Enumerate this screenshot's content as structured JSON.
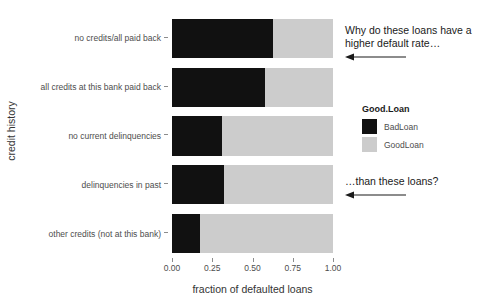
{
  "chart_data": {
    "type": "bar",
    "orientation": "horizontal",
    "stacked": true,
    "normalized": true,
    "title": "",
    "xlabel": "fraction of defaulted loans",
    "ylabel": "credit history",
    "xlim": [
      0,
      1
    ],
    "xticks": [
      "0.00",
      "0.25",
      "0.50",
      "0.75",
      "1.00"
    ],
    "xtick_values": [
      0,
      0.25,
      0.5,
      0.75,
      1
    ],
    "grid": false,
    "legend_position": "right",
    "legend_title": "Good.Loan",
    "categories": [
      "no credits/all paid back",
      "all credits at this bank paid back",
      "no current delinquencies",
      "delinquencies in past",
      "other credits (not at this bank)"
    ],
    "series": [
      {
        "name": "BadLoan",
        "color": "#111111",
        "values": [
          0.625,
          0.575,
          0.31,
          0.325,
          0.175
        ]
      },
      {
        "name": "GoodLoan",
        "color": "#cccccc",
        "values": [
          0.375,
          0.425,
          0.69,
          0.675,
          0.825
        ]
      }
    ]
  },
  "axes": {
    "y_title": "credit history",
    "x_title": "fraction of defaulted loans",
    "x_tick_labels": [
      "0.00",
      "0.25",
      "0.50",
      "0.75",
      "1.00"
    ],
    "y_tick_labels": [
      "no credits/all paid back",
      "all credits at this bank paid back",
      "no current delinquencies",
      "delinquencies in past",
      "other credits (not at this bank)"
    ]
  },
  "legend": {
    "title": "Good.Loan",
    "items": [
      {
        "label": "BadLoan",
        "color": "#111111"
      },
      {
        "label": "GoodLoan",
        "color": "#cccccc"
      }
    ]
  },
  "annotations": [
    {
      "text": "Why do these loans have a higher default rate…",
      "arrow": "left-arrow-icon"
    },
    {
      "text": "…than these loans?",
      "arrow": "left-arrow-icon"
    }
  ]
}
